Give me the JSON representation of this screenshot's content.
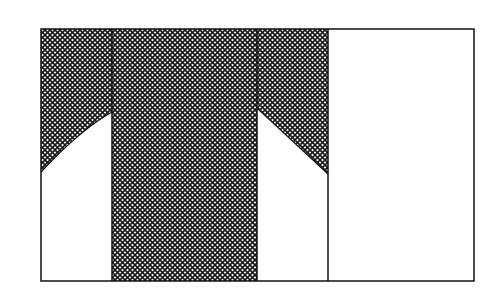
{
  "diagram": {
    "colors": {
      "background": "#ffffff",
      "line": "#111111",
      "hatch": "#1a1a1a"
    },
    "outer_box": {
      "x": 41,
      "y": 29,
      "width": 433,
      "height": 252
    },
    "dividers_x": [
      112,
      257,
      328
    ],
    "sections": [
      {
        "name": "section-1",
        "x0": 41,
        "x1": 112,
        "shading": "upper region above diagonal rising left-to-right",
        "diagonal": [
          [
            41,
            172
          ],
          [
            112,
            112
          ]
        ]
      },
      {
        "name": "section-2",
        "x0": 112,
        "x1": 257,
        "shading": "fully hatched"
      },
      {
        "name": "section-3",
        "x0": 257,
        "x1": 328,
        "shading": "upper region above diagonal falling left-to-right",
        "diagonal": [
          [
            257,
            108
          ],
          [
            328,
            174
          ]
        ]
      },
      {
        "name": "section-4",
        "x0": 328,
        "x1": 474,
        "shading": "none"
      }
    ],
    "hatch_pattern": "cross-hatch (diagonal grid)"
  }
}
